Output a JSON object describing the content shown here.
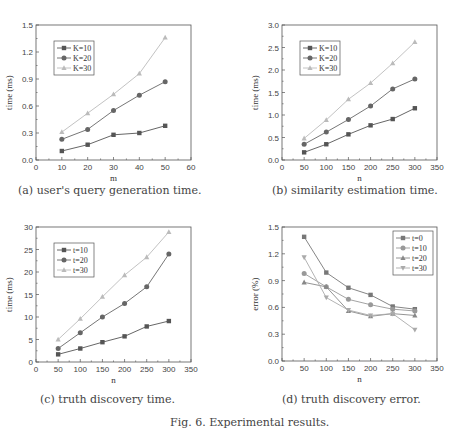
{
  "figure_caption": "Fig. 6. Experimental results.",
  "chart_data": [
    {
      "id": "a",
      "type": "line",
      "caption": "(a)  user's query generation time.",
      "xlabel": "m",
      "ylabel": "time (ms)",
      "xlim": [
        0,
        60
      ],
      "ylim": [
        0,
        1.5
      ],
      "xticks": [
        0,
        10,
        20,
        30,
        40,
        50,
        60
      ],
      "yticks": [
        0.0,
        0.3,
        0.6,
        0.9,
        1.2,
        1.5
      ],
      "ytick_labels": [
        "0.0",
        "0.3",
        "0.6",
        "0.9",
        "1.2",
        "1.5"
      ],
      "x": [
        10,
        20,
        30,
        40,
        50
      ],
      "legend_position": "upper-left",
      "series": [
        {
          "name": "K=10",
          "marker": "square",
          "color": "#555555",
          "values": [
            0.1,
            0.17,
            0.28,
            0.3,
            0.38
          ]
        },
        {
          "name": "K=20",
          "marker": "circle",
          "color": "#666666",
          "values": [
            0.23,
            0.34,
            0.55,
            0.72,
            0.87
          ]
        },
        {
          "name": "K=30",
          "marker": "triangle",
          "color": "#bbbbbb",
          "values": [
            0.31,
            0.52,
            0.73,
            0.96,
            1.36
          ]
        }
      ]
    },
    {
      "id": "b",
      "type": "line",
      "caption": "(b)  similarity estimation time.",
      "xlabel": "n",
      "ylabel": "time (ms)",
      "xlim": [
        0,
        350
      ],
      "ylim": [
        0,
        3.0
      ],
      "xticks": [
        0,
        50,
        100,
        150,
        200,
        250,
        300,
        350
      ],
      "yticks": [
        0.0,
        0.5,
        1.0,
        1.5,
        2.0,
        2.5,
        3.0
      ],
      "ytick_labels": [
        "0.0",
        "0.5",
        "1.0",
        "1.5",
        "2.0",
        "2.5",
        "3.0"
      ],
      "x": [
        50,
        100,
        150,
        200,
        250,
        300
      ],
      "legend_position": "upper-left",
      "series": [
        {
          "name": "K=10",
          "marker": "square",
          "color": "#555555",
          "values": [
            0.17,
            0.35,
            0.57,
            0.77,
            0.91,
            1.15
          ]
        },
        {
          "name": "K=20",
          "marker": "circle",
          "color": "#666666",
          "values": [
            0.35,
            0.62,
            0.9,
            1.2,
            1.58,
            1.8
          ]
        },
        {
          "name": "K=30",
          "marker": "triangle",
          "color": "#bbbbbb",
          "values": [
            0.48,
            0.89,
            1.35,
            1.71,
            2.15,
            2.62
          ]
        }
      ]
    },
    {
      "id": "c",
      "type": "line",
      "caption": "(c)  truth discovery time.",
      "xlabel": "n",
      "ylabel": "time (ms)",
      "xlim": [
        0,
        350
      ],
      "ylim": [
        0,
        30
      ],
      "xticks": [
        0,
        50,
        100,
        150,
        200,
        250,
        300,
        350
      ],
      "yticks": [
        0,
        5,
        10,
        15,
        20,
        25,
        30
      ],
      "ytick_labels": [
        "0",
        "5",
        "10",
        "15",
        "20",
        "25",
        "30"
      ],
      "x": [
        50,
        100,
        150,
        200,
        250,
        300
      ],
      "legend_position": "upper-left",
      "series": [
        {
          "name": "t=10",
          "marker": "square",
          "color": "#555555",
          "values": [
            1.7,
            3.0,
            4.4,
            5.7,
            7.9,
            9.1
          ]
        },
        {
          "name": "t=20",
          "marker": "circle",
          "color": "#666666",
          "values": [
            3.0,
            6.5,
            10.0,
            13.0,
            16.7,
            24.0
          ]
        },
        {
          "name": "t=30",
          "marker": "triangle",
          "color": "#bbbbbb",
          "values": [
            5.0,
            9.6,
            14.5,
            19.3,
            23.3,
            28.9
          ]
        }
      ]
    },
    {
      "id": "d",
      "type": "line",
      "caption": "(d)  truth discovery error.",
      "xlabel": "n",
      "ylabel": "error (%)",
      "xlim": [
        0,
        350
      ],
      "ylim": [
        0,
        1.5
      ],
      "xticks": [
        0,
        50,
        100,
        150,
        200,
        250,
        300,
        350
      ],
      "yticks": [
        0.0,
        0.3,
        0.6,
        0.9,
        1.2,
        1.5
      ],
      "ytick_labels": [
        "0.0",
        "0.3",
        "0.6",
        "0.9",
        "1.2",
        "1.5"
      ],
      "x": [
        50,
        100,
        150,
        200,
        250,
        300
      ],
      "legend_position": "upper-right",
      "series": [
        {
          "name": "t=0",
          "marker": "square",
          "color": "#777777",
          "values": [
            1.39,
            0.99,
            0.82,
            0.74,
            0.61,
            0.58
          ]
        },
        {
          "name": "t=10",
          "marker": "circle",
          "color": "#999999",
          "values": [
            0.98,
            0.83,
            0.69,
            0.63,
            0.58,
            0.56
          ]
        },
        {
          "name": "t=20",
          "marker": "triangle",
          "color": "#888888",
          "values": [
            0.88,
            0.83,
            0.56,
            0.5,
            0.53,
            0.51
          ]
        },
        {
          "name": "t=30",
          "marker": "triangle-down",
          "color": "#aaaaaa",
          "values": [
            1.16,
            0.71,
            0.57,
            0.51,
            0.53,
            0.35
          ]
        }
      ]
    }
  ]
}
